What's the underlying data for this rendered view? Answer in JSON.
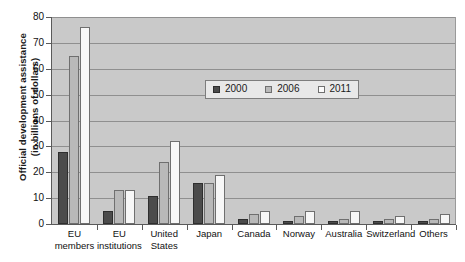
{
  "chart_data": {
    "type": "bar",
    "title": "",
    "xlabel": "",
    "ylabel": "Official development assistance (in billions of dollars)",
    "ylabel_line1": "Official development assistance",
    "ylabel_line2": "(in billions of dollars)",
    "ylim": [
      0,
      80
    ],
    "ytick_step": 10,
    "yticks": [
      "0",
      "10",
      "20",
      "30",
      "40",
      "50",
      "60",
      "70",
      "80"
    ],
    "grid": true,
    "legend_position": "inside-upper-center",
    "categories": [
      "EU members",
      "EU institutions",
      "United States",
      "Japan",
      "Canada",
      "Norway",
      "Australia",
      "Switzerland",
      "Others"
    ],
    "category_lines": [
      [
        "EU",
        "members"
      ],
      [
        "EU",
        "institutions"
      ],
      [
        "United",
        "States"
      ],
      [
        "Japan"
      ],
      [
        "Canada"
      ],
      [
        "Norway"
      ],
      [
        "Australia"
      ],
      [
        "Switzerland"
      ],
      [
        "Others"
      ]
    ],
    "series": [
      {
        "name": "2000",
        "color": "#4b4b4b",
        "values": [
          28,
          5,
          11,
          16,
          2,
          1,
          1,
          1,
          1
        ]
      },
      {
        "name": "2006",
        "color": "#b9b9b9",
        "values": [
          65,
          13,
          24,
          16,
          4,
          3,
          2,
          2,
          2
        ]
      },
      {
        "name": "2011",
        "color": "#f7f7f7",
        "values": [
          76,
          13,
          32,
          19,
          5,
          5,
          5,
          3,
          4
        ]
      }
    ]
  },
  "legend": {
    "entries": [
      {
        "label": "2000"
      },
      {
        "label": "2006"
      },
      {
        "label": "2011"
      }
    ]
  },
  "colors": {
    "plot_background": "#c9c9c9",
    "gridline": "#8f8f8f",
    "axis": "#5a5a5a",
    "series_2000": "#4b4b4b",
    "series_2006": "#b9b9b9",
    "series_2011": "#f7f7f7",
    "legend_background": "#e8e8e8"
  }
}
